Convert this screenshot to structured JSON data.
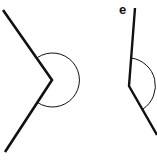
{
  "figures": [
    {
      "id": "reflex-angle-left",
      "label": "",
      "ray1": [
        [
          3,
          10
        ],
        [
          52,
          80
        ]
      ],
      "ray2": [
        [
          52,
          80
        ],
        [
          5,
          152
        ]
      ],
      "arc_radius": 27
    },
    {
      "id": "reflex-angle-right",
      "label": "e",
      "ray1": [
        [
          135,
          8
        ],
        [
          129,
          86
        ]
      ],
      "ray2": [
        [
          129,
          86
        ],
        [
          157,
          135
        ]
      ],
      "arc_radius": 28
    }
  ],
  "colors": {
    "line": "#111111",
    "background": "#ffffff"
  }
}
